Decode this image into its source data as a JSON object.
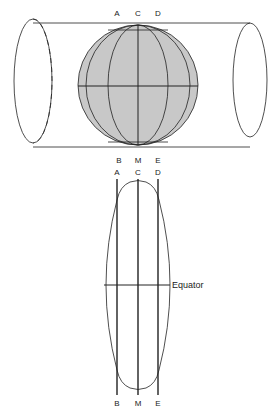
{
  "diagram": {
    "top_figure": {
      "labels_top": [
        "A",
        "C",
        "D"
      ],
      "labels_bottom": [
        "B",
        "M",
        "E"
      ],
      "globe_fill": "#c8c8c8",
      "line_color": "#222222"
    },
    "bottom_figure": {
      "labels_top": [
        "A",
        "C",
        "D"
      ],
      "labels_bottom": [
        "B",
        "M",
        "E"
      ],
      "equator_label": "Equator"
    }
  }
}
